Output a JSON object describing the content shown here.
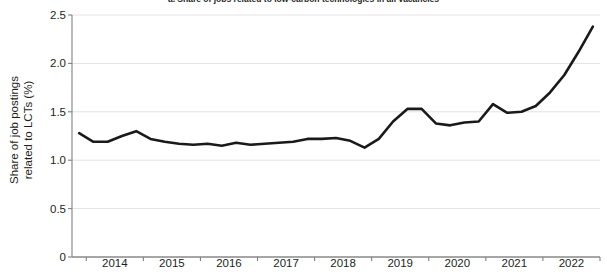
{
  "chart_data": {
    "type": "line",
    "title": "a. Share of jobs related to low-carbon technologies in all vacancies",
    "xlabel": "",
    "ylabel": "Share of job postings related to LCTs (%)",
    "ylabel_line1": "Share of job postings",
    "ylabel_line2": "related to LCTs (%)",
    "ylim": [
      0,
      2.5
    ],
    "yticks": [
      0,
      0.5,
      1.0,
      1.5,
      2.0,
      2.5
    ],
    "ytick_labels": [
      "0",
      "0.5",
      "1.0",
      "1.5",
      "2.0",
      "2.5"
    ],
    "xlim": [
      2013.75,
      2023.0
    ],
    "xticks": [
      2014.0,
      2015.0,
      2016.0,
      2017.0,
      2018.0,
      2019.0,
      2020.0,
      2021.0,
      2022.0,
      2023.0
    ],
    "xtick_labels": [
      "2014",
      "2015",
      "2016",
      "2017",
      "2018",
      "2019",
      "2020",
      "2021",
      "2022"
    ],
    "xtick_label_positions": [
      2014.5,
      2015.5,
      2016.5,
      2017.5,
      2018.5,
      2019.5,
      2020.5,
      2021.5,
      2022.5
    ],
    "grid": "horizontal",
    "legend": "none",
    "line_color": "#1a1a1a",
    "line_width": 2.6,
    "series": [
      {
        "name": "Share of job postings related to LCTs (%)",
        "x": [
          2013.875,
          2014.125,
          2014.375,
          2014.625,
          2014.875,
          2015.125,
          2015.375,
          2015.625,
          2015.875,
          2016.125,
          2016.375,
          2016.625,
          2016.875,
          2017.125,
          2017.375,
          2017.625,
          2017.875,
          2018.125,
          2018.375,
          2018.625,
          2018.875,
          2019.125,
          2019.375,
          2019.625,
          2019.875,
          2020.125,
          2020.375,
          2020.625,
          2020.875,
          2021.125,
          2021.375,
          2021.625,
          2021.875,
          2022.125,
          2022.375,
          2022.625,
          2022.875
        ],
        "values": [
          1.28,
          1.19,
          1.19,
          1.25,
          1.3,
          1.22,
          1.19,
          1.17,
          1.16,
          1.17,
          1.15,
          1.18,
          1.16,
          1.17,
          1.18,
          1.19,
          1.22,
          1.22,
          1.23,
          1.2,
          1.13,
          1.22,
          1.4,
          1.53,
          1.53,
          1.38,
          1.36,
          1.39,
          1.4,
          1.58,
          1.49,
          1.5,
          1.56,
          1.7,
          1.88,
          2.12,
          2.38
        ]
      }
    ]
  }
}
